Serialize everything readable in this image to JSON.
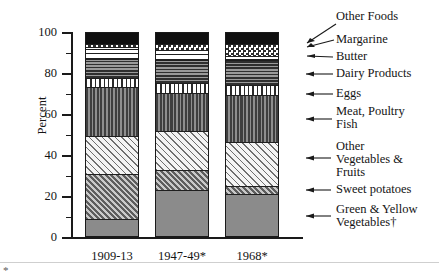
{
  "axis": {
    "y_title": "Percent",
    "y_ticks_major": [
      "0",
      "20",
      "40",
      "60",
      "80",
      "100"
    ],
    "y_min": 0,
    "y_max": 100
  },
  "x_labels": [
    "1909-13",
    "1947-49*",
    "1968*"
  ],
  "legend": [
    {
      "label": "Other Foods",
      "pattern": "black"
    },
    {
      "label": "Margarine",
      "pattern": "checker"
    },
    {
      "label": "Butter",
      "pattern": "horizontal-light"
    },
    {
      "label": "Dairy Products",
      "pattern": "horizontal-dark"
    },
    {
      "label": "Eggs",
      "pattern": "vertical-light"
    },
    {
      "label": "Meat, Poultry\nFish",
      "pattern": "vertical-dark"
    },
    {
      "label": "Other\nVegetables &\nFruits",
      "pattern": "diagonal-light"
    },
    {
      "label": "Sweet potatoes",
      "pattern": "diagonal-dark"
    },
    {
      "label": "Green & Yellow\nVegetables†",
      "pattern": "solid-gray"
    }
  ],
  "footnote_mark": "*",
  "chart_data": {
    "type": "bar",
    "stacked": true,
    "title": "",
    "xlabel": "",
    "ylabel": "Percent",
    "ylim": [
      0,
      100
    ],
    "grid": false,
    "legend_position": "right-with-leader-lines",
    "categories": [
      "1909-13",
      "1947-49*",
      "1968*"
    ],
    "series": [
      {
        "name": "Green & Yellow Vegetables†",
        "values": [
          8,
          22,
          20
        ]
      },
      {
        "name": "Sweet potatoes",
        "values": [
          22,
          10,
          4
        ]
      },
      {
        "name": "Other Vegetables & Fruits",
        "values": [
          19,
          19,
          22
        ]
      },
      {
        "name": "Meat, Poultry Fish",
        "values": [
          24,
          19,
          23
        ]
      },
      {
        "name": "Eggs",
        "values": [
          4.5,
          5,
          5
        ]
      },
      {
        "name": "Dairy Products",
        "values": [
          9,
          11,
          12
        ]
      },
      {
        "name": "Butter",
        "values": [
          6,
          5,
          2
        ]
      },
      {
        "name": "Margarine",
        "values": [
          1.5,
          3,
          6
        ]
      },
      {
        "name": "Other Foods",
        "values": [
          6,
          6,
          6
        ]
      }
    ]
  }
}
